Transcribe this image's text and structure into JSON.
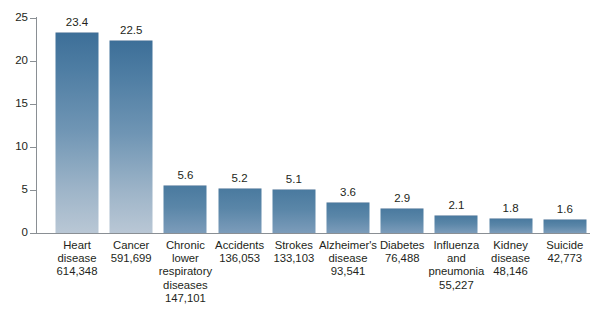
{
  "chart_data": {
    "type": "bar",
    "title": "",
    "xlabel": "",
    "ylabel": "",
    "ylim": [
      0,
      25
    ],
    "yticks": [
      0,
      5,
      10,
      15,
      20,
      25
    ],
    "grid": false,
    "legend": null,
    "categories": [
      "Heart disease",
      "Cancer",
      "Chronic lower respiratory diseases",
      "Accidents",
      "Strokes",
      "Alzheimer's disease",
      "Diabetes",
      "Influenza and pneumonia",
      "Kidney disease",
      "Suicide"
    ],
    "values": [
      23.4,
      22.5,
      5.6,
      5.2,
      5.1,
      3.6,
      2.9,
      2.1,
      1.8,
      1.6
    ],
    "counts": [
      "614,348",
      "591,699",
      "147,101",
      "136,053",
      "133,103",
      "93,541",
      "76,488",
      "55,227",
      "48,146",
      "42,773"
    ],
    "bars": [
      {
        "category": "Heart disease",
        "label_lines": [
          "Heart",
          "disease"
        ],
        "count": "614,348",
        "value": 23.4,
        "value_label": "23.4"
      },
      {
        "category": "Cancer",
        "label_lines": [
          "Cancer"
        ],
        "count": "591,699",
        "value": 22.5,
        "value_label": "22.5"
      },
      {
        "category": "Chronic lower respiratory diseases",
        "label_lines": [
          "Chronic",
          "lower",
          "respiratory",
          "diseases"
        ],
        "count": "147,101",
        "value": 5.6,
        "value_label": "5.6"
      },
      {
        "category": "Accidents",
        "label_lines": [
          "Accidents"
        ],
        "count": "136,053",
        "value": 5.2,
        "value_label": "5.2"
      },
      {
        "category": "Strokes",
        "label_lines": [
          "Strokes"
        ],
        "count": "133,103",
        "value": 5.1,
        "value_label": "5.1"
      },
      {
        "category": "Alzheimer's disease",
        "label_lines": [
          "Alzheimer's",
          "disease"
        ],
        "count": "93,541",
        "value": 3.6,
        "value_label": "3.6"
      },
      {
        "category": "Diabetes",
        "label_lines": [
          "Diabetes"
        ],
        "count": "76,488",
        "value": 2.9,
        "value_label": "2.9"
      },
      {
        "category": "Influenza and pneumonia",
        "label_lines": [
          "Influenza",
          "and",
          "pneumonia"
        ],
        "count": "55,227",
        "value": 2.1,
        "value_label": "2.1"
      },
      {
        "category": "Kidney disease",
        "label_lines": [
          "Kidney",
          "disease"
        ],
        "count": "48,146",
        "value": 1.8,
        "value_label": "1.8"
      },
      {
        "category": "Suicide",
        "label_lines": [
          "Suicide"
        ],
        "count": "42,773",
        "value": 1.6,
        "value_label": "1.6"
      }
    ],
    "colors": {
      "bar_top": "#3d6f98",
      "bar_bottom": "#b9c7d5",
      "axis": "#8a8f94",
      "text": "#231f20",
      "background": "#ffffff"
    }
  },
  "caption": {
    "text": ""
  }
}
